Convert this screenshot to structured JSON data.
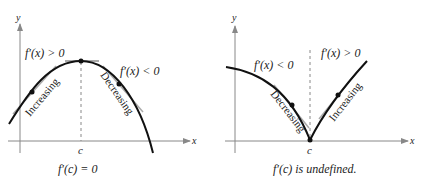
{
  "left_graph": {
    "axis_x_label": "x",
    "axis_y_label": "y",
    "tick_label": "c",
    "left_condition": "f′(x) > 0",
    "right_condition": "f′(x) < 0",
    "left_trend": "Increasing",
    "right_trend": "Decreasing",
    "caption": "f′(c) = 0"
  },
  "right_graph": {
    "axis_x_label": "x",
    "axis_y_label": "y",
    "tick_label": "c",
    "left_condition": "f′(x) < 0",
    "right_condition": "f′(x) > 0",
    "left_trend": "Decreasing",
    "right_trend": "Increasing",
    "caption": "f′(c) is undefined."
  },
  "colors": {
    "curve": "#111111",
    "axis": "#888888",
    "tangent": "#aaaaaa",
    "dashed": "#888888"
  }
}
